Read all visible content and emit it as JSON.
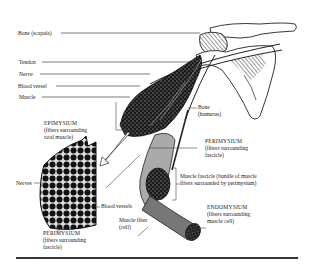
{
  "figure": {
    "labels": {
      "bone_scapula": "Bone (scapula)",
      "tendon": "Tendon",
      "nerve": "Nerve",
      "blood_vessel": "Blood vessel",
      "muscle": "Muscle",
      "bone_humerus_1": "Bone",
      "bone_humerus_2": "(humerus)",
      "epimysium_title": "EPIMYSIUM",
      "epimysium_desc_1": "(fibers surrounding",
      "epimysium_desc_2": "total muscle)",
      "perimysium_right_title": "PERIMYSIUM",
      "perimysium_right_desc_1": "(fibers surrounding",
      "perimysium_right_desc_2": "fascicle)",
      "muscle_fascicle_1": "Muscle fascicle (bundle of muscle",
      "muscle_fascicle_2": "fibers surrounded by perimysium)",
      "endomysium_title": "ENDOMYSIUM",
      "endomysium_desc_1": "(fibers surrounding",
      "endomysium_desc_2": "muscle cell)",
      "nerves": "Nerves",
      "blood_vessels": "Blood vessels",
      "muscle_fiber_1": "Muscle fiber",
      "muscle_fiber_2": "(cell)",
      "perimysium_left_title": "PERIMYSIUM",
      "perimysium_left_desc_1": "(fibers surrounding",
      "perimysium_left_desc_2": "fascicle)"
    }
  }
}
